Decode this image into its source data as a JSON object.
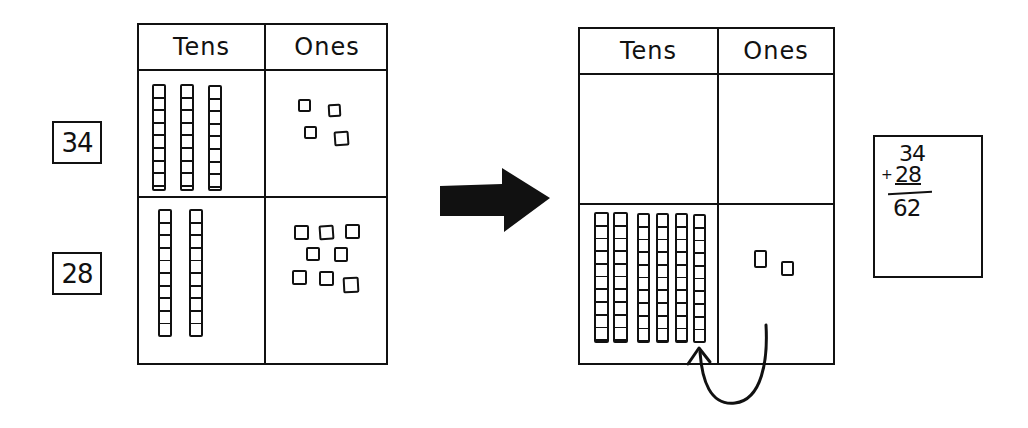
{
  "diagram": {
    "numbers": {
      "first": "34",
      "second": "28"
    },
    "before_chart": {
      "headers": {
        "tens": "Tens",
        "ones": "Ones"
      },
      "rows": [
        {
          "label": "34",
          "tens_rods": 3,
          "ones_units": 4
        },
        {
          "label": "28",
          "tens_rods": 2,
          "ones_units": 8
        }
      ]
    },
    "transition_arrow": "right-arrow",
    "after_chart": {
      "headers": {
        "tens": "Tens",
        "ones": "Ones"
      },
      "rows": [
        {
          "label": "",
          "tens_rods": 0,
          "ones_units": 0
        },
        {
          "label": "",
          "tens_rods": 6,
          "ones_units": 2
        }
      ],
      "regroup_arrow": "curved-arrow from ones to tens (10 ones become 1 ten)"
    },
    "calculation": {
      "addend1": "34",
      "operator": "+",
      "addend2": "28",
      "sum": "62"
    },
    "colors": {
      "ink": "#111111",
      "background": "#ffffff"
    }
  }
}
